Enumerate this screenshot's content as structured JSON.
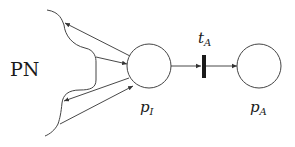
{
  "diagram": {
    "type": "petri-net",
    "subnet_label": "PN",
    "places": [
      {
        "id": "p_I",
        "name": "p",
        "subscript": "I"
      },
      {
        "id": "p_A",
        "name": "p",
        "subscript": "A"
      }
    ],
    "transitions": [
      {
        "id": "t_A",
        "name": "t",
        "subscript": "A"
      }
    ],
    "arcs": [
      {
        "from": "p_I",
        "to": "PN"
      },
      {
        "from": "PN",
        "to": "p_I"
      },
      {
        "from": "p_I",
        "to": "PN"
      },
      {
        "from": "PN",
        "to": "p_I"
      },
      {
        "from": "p_I",
        "to": "t_A"
      },
      {
        "from": "t_A",
        "to": "p_A"
      }
    ],
    "colors": {
      "stroke": "#333333",
      "transition": "#1a1a1a"
    }
  }
}
